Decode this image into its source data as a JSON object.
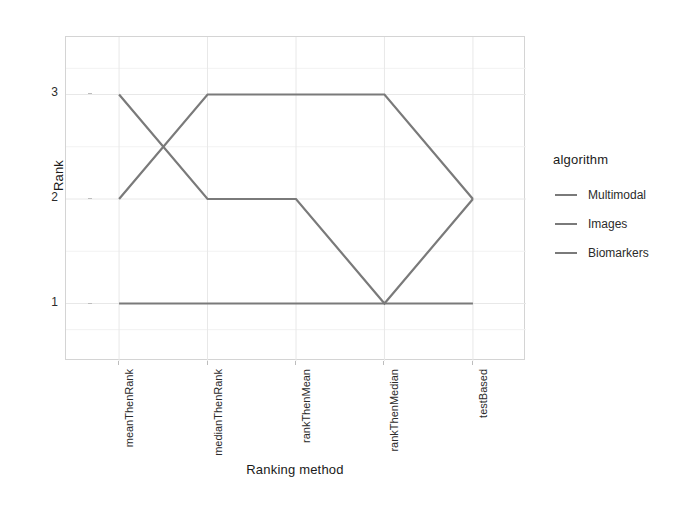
{
  "chart_data": {
    "type": "line",
    "title": "",
    "xlabel": "Ranking method",
    "ylabel": "Rank",
    "categories": [
      "meanThenRank",
      "medianThenRank",
      "rankThenMean",
      "rankThenMedian",
      "testBased"
    ],
    "series": [
      {
        "name": "Multimodal",
        "values": [
          1,
          1,
          1,
          1,
          1
        ],
        "color": "#7a7a7a"
      },
      {
        "name": "Images",
        "values": [
          3,
          2,
          2,
          1,
          2
        ],
        "color": "#7a7a7a"
      },
      {
        "name": "Biomarkers",
        "values": [
          2,
          3,
          3,
          3,
          2
        ],
        "color": "#7a7a7a"
      }
    ],
    "ylim": [
      0.45,
      3.55
    ],
    "yticks": [
      3,
      2,
      1
    ],
    "ytick_labels": [
      "3",
      "2",
      "1"
    ],
    "grid": true,
    "legend_position": "right",
    "legend_title": "algorithm"
  },
  "axes": {
    "y_title": "Rank",
    "x_title": "Ranking method",
    "y_tick_labels": [
      "3",
      "2",
      "1"
    ],
    "x_tick_labels": [
      "meanThenRank",
      "medianThenRank",
      "rankThenMean",
      "rankThenMedian",
      "testBased"
    ]
  },
  "legend": {
    "title": "algorithm",
    "items": [
      {
        "label": "Multimodal"
      },
      {
        "label": "Images"
      },
      {
        "label": "Biomarkers"
      }
    ]
  },
  "colors": {
    "line": "#7a7a7a",
    "grid": "#e8e8e8",
    "panel_border": "#d4d4d4",
    "text": "#2b2b2b",
    "background": "#ffffff"
  }
}
